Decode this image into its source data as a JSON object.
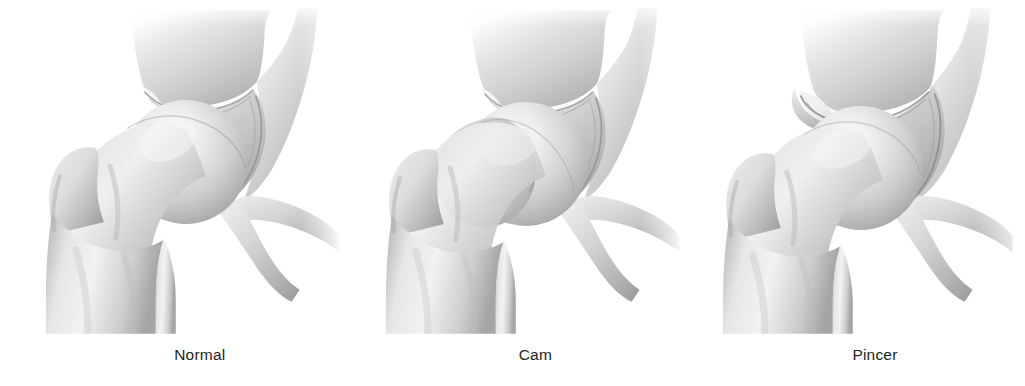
{
  "figure": {
    "background_color": "#ffffff",
    "label_color": "#231f20",
    "bone_tone_light": "#f2f2f2",
    "bone_tone_mid": "#c9c9c9",
    "bone_tone_dark": "#9a9a9a",
    "bone_tone_edge": "#8a8a8a"
  },
  "panels": [
    {
      "id": "normal",
      "label": "Normal",
      "description": "Normal hip joint with spherical femoral head and normally covered acetabulum",
      "anatomy": {
        "femoral_head": "spherical",
        "head_neck_junction": "normal concave offset",
        "acetabular_rim": "normal coverage"
      }
    },
    {
      "id": "cam",
      "label": "Cam",
      "description": "Cam-type femoroacetabular impingement with aspherical bump at the femoral head-neck junction",
      "anatomy": {
        "femoral_head": "aspherical with anterolateral bump",
        "head_neck_junction": "loss of offset, convex bump",
        "acetabular_rim": "normal coverage"
      }
    },
    {
      "id": "pincer",
      "label": "Pincer",
      "description": "Pincer-type femoroacetabular impingement with overhanging acetabular rim covering the femoral head",
      "anatomy": {
        "femoral_head": "spherical",
        "head_neck_junction": "normal concave offset",
        "acetabular_rim": "overhanging / excessive coverage"
      }
    }
  ]
}
